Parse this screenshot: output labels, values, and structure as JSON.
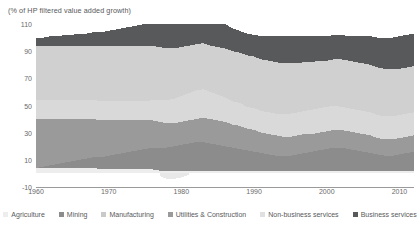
{
  "chart_data": {
    "type": "area",
    "stacked": true,
    "title": "(% of HP filtered value added growth)",
    "xlabel": "",
    "ylabel": "",
    "ylim": [
      -10,
      110
    ],
    "xlim": [
      1960,
      2012
    ],
    "yticks": [
      110,
      90,
      70,
      50,
      30,
      10,
      -10
    ],
    "xticks": [
      1960,
      1970,
      1980,
      1990,
      2000,
      2010
    ],
    "grid": false,
    "legend_position": "bottom",
    "colors": {
      "agriculture": "#ededed",
      "mining": "#8c8c8c",
      "manufacturing": "#9a9a9a",
      "utilities_construction": "#d9d9d9",
      "non_business_services": "#d0d0d0",
      "business_services": "#58595b",
      "axis": "#9a9a9a",
      "text": "#58595b"
    },
    "x": [
      1960,
      1961,
      1962,
      1963,
      1964,
      1965,
      1966,
      1967,
      1968,
      1969,
      1970,
      1971,
      1972,
      1973,
      1974,
      1975,
      1976,
      1977,
      1978,
      1979,
      1980,
      1981,
      1982,
      1983,
      1984,
      1985,
      1986,
      1987,
      1988,
      1989,
      1990,
      1991,
      1992,
      1993,
      1994,
      1995,
      1996,
      1997,
      1998,
      1999,
      2000,
      2001,
      2002,
      2003,
      2004,
      2005,
      2006,
      2007,
      2008,
      2009,
      2010,
      2011,
      2012
    ],
    "series": [
      {
        "name": "Agriculture",
        "color": "#ededed",
        "values": [
          4,
          4,
          4,
          4,
          4,
          4,
          4,
          4,
          4,
          3,
          3,
          3,
          3,
          3,
          3,
          3,
          3,
          2,
          2,
          2,
          2,
          2,
          2,
          2,
          2,
          2,
          2,
          2,
          2,
          2,
          2,
          2,
          2,
          2,
          2,
          2,
          2,
          2,
          2,
          2,
          2,
          2,
          2,
          2,
          2,
          2,
          2,
          2,
          2,
          2,
          2,
          2,
          2
        ]
      },
      {
        "name": "Mining",
        "color": "#8c8c8c",
        "values": [
          0,
          1,
          2,
          3,
          4,
          5,
          6,
          7,
          8,
          9,
          10,
          11,
          12,
          13,
          14,
          15,
          16,
          17,
          17,
          18,
          19,
          20,
          21,
          21,
          20,
          19,
          18,
          17,
          16,
          15,
          14,
          13,
          12,
          11,
          11,
          11,
          12,
          13,
          14,
          15,
          16,
          17,
          17,
          16,
          15,
          14,
          13,
          12,
          11,
          11,
          12,
          13,
          14
        ]
      },
      {
        "name": "Manufacturing",
        "color": "#9a9a9a",
        "values": [
          36,
          35,
          34,
          33,
          32,
          31,
          30,
          29,
          28,
          27,
          26,
          25,
          24,
          23,
          22,
          21,
          20,
          19,
          18,
          17,
          17,
          17,
          17,
          18,
          18,
          18,
          18,
          17,
          17,
          16,
          16,
          15,
          15,
          15,
          14,
          14,
          14,
          14,
          13,
          13,
          13,
          13,
          13,
          13,
          13,
          13,
          13,
          12,
          12,
          12,
          12,
          12,
          12
        ]
      },
      {
        "name": "Utilities & Construction",
        "color": "#d9d9d9",
        "values": [
          14,
          14,
          14,
          14,
          14,
          14,
          14,
          14,
          14,
          14,
          14,
          14,
          14,
          14,
          14,
          14,
          15,
          16,
          17,
          18,
          19,
          20,
          21,
          21,
          20,
          19,
          18,
          17,
          17,
          16,
          16,
          16,
          16,
          16,
          17,
          17,
          17,
          17,
          18,
          18,
          18,
          18,
          17,
          17,
          17,
          17,
          17,
          17,
          17,
          17,
          17,
          17,
          17
        ]
      },
      {
        "name": "Non-business services",
        "color": "#d0d0d0",
        "values": [
          40,
          40,
          40,
          40,
          40,
          40,
          40,
          40,
          40,
          41,
          41,
          41,
          41,
          41,
          41,
          41,
          40,
          39,
          38,
          37,
          36,
          35,
          34,
          34,
          34,
          35,
          36,
          37,
          37,
          38,
          38,
          38,
          38,
          38,
          37,
          37,
          36,
          36,
          35,
          35,
          34,
          34,
          35,
          35,
          35,
          35,
          35,
          35,
          35,
          35,
          34,
          34,
          34
        ]
      },
      {
        "name": "Business services",
        "color": "#58595b",
        "values": [
          6,
          6,
          7,
          7,
          8,
          8,
          9,
          9,
          10,
          10,
          11,
          12,
          13,
          14,
          15,
          16,
          16,
          17,
          18,
          19,
          22,
          24,
          26,
          24,
          22,
          20,
          18,
          17,
          16,
          16,
          16,
          17,
          18,
          19,
          20,
          20,
          20,
          19,
          19,
          18,
          18,
          18,
          18,
          18,
          19,
          20,
          21,
          22,
          23,
          23,
          24,
          24,
          24
        ]
      }
    ],
    "negative_band": {
      "name": "Agriculture",
      "note": "small negative excursion below axis around 1977-1981",
      "color": "#e8e8e8",
      "x": [
        1977,
        1978,
        1979,
        1980,
        1981
      ],
      "values": [
        -2,
        -4,
        -4,
        -3,
        -1
      ]
    }
  },
  "legend": {
    "items": [
      {
        "label": "Agriculture",
        "color": "#ededed"
      },
      {
        "label": "Mining",
        "color": "#8c8c8c"
      },
      {
        "label": "Manufacturing",
        "color": "#c9c9c9"
      },
      {
        "label": "Utilities & Construction",
        "color": "#9a9a9a"
      },
      {
        "label": "Non-business services",
        "color": "#e0e0e0"
      },
      {
        "label": "Business services",
        "color": "#58595b"
      }
    ]
  }
}
